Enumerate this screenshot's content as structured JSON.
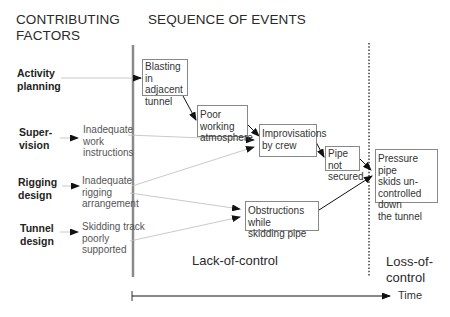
{
  "headings": {
    "left": [
      "CONTRIBUTING",
      "FACTORS"
    ],
    "right": "SEQUENCE OF EVENTS"
  },
  "factors": [
    {
      "label": [
        "Activity",
        "planning"
      ]
    },
    {
      "label": [
        "Super-",
        "vision"
      ],
      "cause": [
        "Inadequate",
        "work",
        "instructions"
      ]
    },
    {
      "label": [
        "Rigging",
        "design"
      ],
      "cause": [
        "Inadequate",
        "rigging",
        "arrangement"
      ]
    },
    {
      "label": [
        "Tunnel",
        "design"
      ],
      "cause": [
        "Skidding track",
        "poorly",
        "supported"
      ]
    }
  ],
  "events": [
    {
      "id": "blasting",
      "text": [
        "Blasting in",
        "adjacent",
        "tunnel"
      ]
    },
    {
      "id": "poor-working",
      "text": [
        "Poor working",
        "atmosphere"
      ]
    },
    {
      "id": "improvisations",
      "text": [
        "Improvisations",
        "by crew"
      ]
    },
    {
      "id": "pipe-not-secured",
      "text": [
        "Pipe not",
        "secured"
      ]
    },
    {
      "id": "obstructions",
      "text": [
        "Obstructions while",
        "skidding pipe"
      ]
    },
    {
      "id": "pressure-pipe",
      "text": [
        "Pressure pipe",
        "skids un-",
        "controlled down",
        "the tunnel"
      ]
    }
  ],
  "phases": {
    "lack": "Lack-of-control",
    "loss": [
      "Loss-of-",
      "control"
    ]
  },
  "axis": {
    "label": "Time"
  },
  "colors": {
    "solid_divider": "#888888",
    "thin_line": "#bbbbbb",
    "arrow": "#111111",
    "box_border": "#888888"
  }
}
